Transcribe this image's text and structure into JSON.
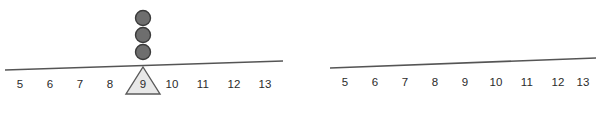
{
  "canvas": {
    "width": 596,
    "height": 116,
    "background": "#ffffff"
  },
  "style": {
    "line_color": "#555555",
    "dot_fill": "#6e6e6e",
    "dot_stroke": "#3a3a3a",
    "triangle_fill": "#e8e8e8",
    "triangle_stroke": "#5a5a5a",
    "label_color": "#2b2b2b"
  },
  "panels": [
    {
      "id": "left",
      "name": "number-line-with-marker",
      "line": {
        "x1": 5,
        "y1": 70,
        "x2": 283,
        "y2": 61,
        "width": 1.6
      },
      "tick_labels": [
        "5",
        "6",
        "7",
        "8",
        "9",
        "10",
        "11",
        "12",
        "13"
      ],
      "tick_x": [
        20,
        50,
        80,
        110,
        140,
        172,
        203,
        234,
        265
      ],
      "tick_y": 84,
      "marker": {
        "type": "triangle",
        "label": "9",
        "center_x": 143,
        "apex_y": 67,
        "base_y": 94,
        "half_width": 17
      },
      "dots": {
        "count": 3,
        "center_x": 143,
        "centers_y": [
          18,
          35,
          52
        ],
        "radius": 7.5
      }
    },
    {
      "id": "right",
      "name": "number-line-blank",
      "line": {
        "x1": 32,
        "y1": 68,
        "x2": 298,
        "y2": 58,
        "width": 1.6
      },
      "tick_labels": [
        "5",
        "6",
        "7",
        "8",
        "9",
        "10",
        "11",
        "12",
        "13"
      ],
      "tick_x": [
        47,
        77,
        107,
        137,
        167,
        198,
        229,
        260,
        285
      ],
      "tick_y": 82,
      "marker": null,
      "dots": {
        "count": 0,
        "centers_y": []
      }
    }
  ]
}
